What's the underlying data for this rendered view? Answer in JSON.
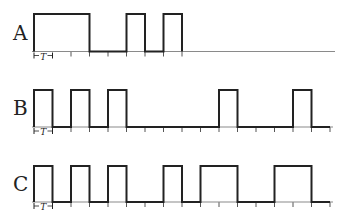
{
  "diagram": {
    "type": "timing-diagram",
    "period_label": "T",
    "colors": {
      "signal": "#222222",
      "baseline": "#8a8a8a",
      "tick": "#555555",
      "text": "#222222"
    },
    "geometry": {
      "x0": 34,
      "period_px": 18.5
    },
    "rows": [
      {
        "name": "A",
        "label": "A",
        "top_y": 14,
        "base_y": 51.5,
        "line_end_x": 335,
        "tick_count": 8,
        "pulses": [
          [
            0,
            3
          ],
          [
            5,
            6
          ],
          [
            7,
            8
          ]
        ]
      },
      {
        "name": "B",
        "label": "B",
        "top_y": 90,
        "base_y": 127,
        "line_end_x": 333,
        "tick_count": 16,
        "pulses": [
          [
            0,
            1
          ],
          [
            2,
            3
          ],
          [
            4,
            5
          ],
          [
            10,
            11
          ],
          [
            14,
            15
          ]
        ]
      },
      {
        "name": "C",
        "label": "C",
        "top_y": 166,
        "base_y": 202,
        "line_end_x": 333,
        "tick_count": 16,
        "pulses": [
          [
            0,
            1
          ],
          [
            2,
            3
          ],
          [
            4,
            5
          ],
          [
            7,
            8
          ],
          [
            9,
            11
          ],
          [
            13,
            15
          ]
        ]
      }
    ]
  }
}
